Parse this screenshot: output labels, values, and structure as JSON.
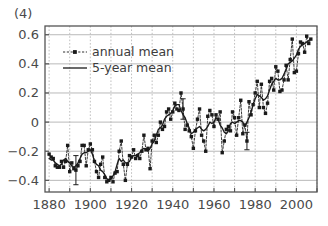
{
  "panel": {
    "label": "(4)"
  },
  "chart_data": {
    "type": "line",
    "title": "",
    "subtitle": "",
    "xlabel": "",
    "ylabel": "",
    "xlim": [
      1878,
      2010
    ],
    "ylim": [
      -0.48,
      0.66
    ],
    "grid": true,
    "x_major_ticks": [
      1880,
      1900,
      1920,
      1940,
      1960,
      1980,
      2000
    ],
    "x_major_tick_labels": [
      "1880",
      "1900",
      "1920",
      "1940",
      "1960",
      "1980",
      "2000"
    ],
    "x_minor_ticks": [
      1890,
      1910,
      1930,
      1950,
      1970,
      1990,
      2010
    ],
    "y_ticks": [
      -0.4,
      -0.2,
      0,
      0.2,
      0.4,
      0.6
    ],
    "y_tick_labels": [
      "−0.4",
      "−0.2",
      "0",
      "0.2",
      "0.4",
      "0.6"
    ],
    "legend_position": "upper left",
    "legend": [
      {
        "name": "annual mean",
        "style": "dashed-marker",
        "marker": "square",
        "color": "#1a1a1a"
      },
      {
        "name": "5-year mean",
        "style": "solid",
        "marker": "none",
        "color": "#1a1a1a"
      }
    ],
    "colors": {
      "annual_mean": "#1a1a1a",
      "five_year_mean": "#1a1a1a",
      "grid": "#b9b9b9",
      "axis": "#555555",
      "background": "#ffffff",
      "text": "#4a4a4a"
    },
    "x": [
      1880,
      1881,
      1882,
      1883,
      1884,
      1885,
      1886,
      1887,
      1888,
      1889,
      1890,
      1891,
      1892,
      1893,
      1894,
      1895,
      1896,
      1897,
      1898,
      1899,
      1900,
      1901,
      1902,
      1903,
      1904,
      1905,
      1906,
      1907,
      1908,
      1909,
      1910,
      1911,
      1912,
      1913,
      1914,
      1915,
      1916,
      1917,
      1918,
      1919,
      1920,
      1921,
      1922,
      1923,
      1924,
      1925,
      1926,
      1927,
      1928,
      1929,
      1930,
      1931,
      1932,
      1933,
      1934,
      1935,
      1936,
      1937,
      1938,
      1939,
      1940,
      1941,
      1942,
      1943,
      1944,
      1945,
      1946,
      1947,
      1948,
      1949,
      1950,
      1951,
      1952,
      1953,
      1954,
      1955,
      1956,
      1957,
      1958,
      1959,
      1960,
      1961,
      1962,
      1963,
      1964,
      1965,
      1966,
      1967,
      1968,
      1969,
      1970,
      1971,
      1972,
      1973,
      1974,
      1975,
      1976,
      1977,
      1978,
      1979,
      1980,
      1981,
      1982,
      1983,
      1984,
      1985,
      1986,
      1987,
      1988,
      1989,
      1990,
      1991,
      1992,
      1993,
      1994,
      1995,
      1996,
      1997,
      1998,
      1999,
      2000,
      2001,
      2002,
      2003,
      2004,
      2005,
      2006,
      2007
    ],
    "series": [
      {
        "name": "annual mean",
        "style": "dashed-marker",
        "values": [
          -0.22,
          -0.24,
          -0.25,
          -0.3,
          -0.31,
          -0.31,
          -0.27,
          -0.31,
          -0.27,
          -0.16,
          -0.34,
          -0.28,
          -0.32,
          -0.33,
          -0.3,
          -0.27,
          -0.16,
          -0.16,
          -0.3,
          -0.19,
          -0.15,
          -0.19,
          -0.27,
          -0.34,
          -0.38,
          -0.29,
          -0.24,
          -0.38,
          -0.41,
          -0.4,
          -0.38,
          -0.41,
          -0.35,
          -0.34,
          -0.2,
          -0.13,
          -0.29,
          -0.4,
          -0.29,
          -0.23,
          -0.24,
          -0.19,
          -0.25,
          -0.23,
          -0.25,
          -0.2,
          -0.09,
          -0.19,
          -0.18,
          -0.32,
          -0.13,
          -0.09,
          -0.14,
          -0.09,
          0.0,
          -0.05,
          -0.03,
          0.07,
          0.09,
          0.02,
          0.07,
          0.13,
          0.09,
          0.08,
          0.2,
          0.09,
          -0.05,
          -0.02,
          -0.06,
          -0.1,
          -0.18,
          -0.06,
          0.02,
          0.09,
          -0.09,
          -0.13,
          -0.2,
          0.04,
          0.08,
          0.05,
          -0.03,
          0.05,
          0.02,
          0.07,
          -0.21,
          -0.13,
          -0.05,
          -0.03,
          -0.06,
          0.07,
          0.03,
          -0.09,
          0.03,
          0.15,
          -0.08,
          -0.02,
          -0.13,
          0.14,
          0.05,
          0.12,
          0.2,
          0.28,
          0.1,
          0.26,
          0.1,
          0.06,
          0.13,
          0.28,
          0.3,
          0.22,
          0.38,
          0.35,
          0.21,
          0.22,
          0.29,
          0.39,
          0.29,
          0.43,
          0.57,
          0.34,
          0.35,
          0.47,
          0.55,
          0.54,
          0.48,
          0.59,
          0.54,
          0.57
        ]
      },
      {
        "name": "5-year mean",
        "style": "solid",
        "values": [
          -0.25,
          -0.26,
          -0.26,
          -0.28,
          -0.29,
          -0.3,
          -0.29,
          -0.26,
          -0.25,
          -0.27,
          -0.28,
          -0.3,
          -0.31,
          -0.3,
          -0.28,
          -0.25,
          -0.22,
          -0.21,
          -0.21,
          -0.2,
          -0.19,
          -0.22,
          -0.27,
          -0.29,
          -0.3,
          -0.33,
          -0.34,
          -0.36,
          -0.39,
          -0.4,
          -0.39,
          -0.37,
          -0.34,
          -0.29,
          -0.25,
          -0.27,
          -0.26,
          -0.28,
          -0.28,
          -0.27,
          -0.24,
          -0.23,
          -0.23,
          -0.22,
          -0.21,
          -0.19,
          -0.18,
          -0.19,
          -0.2,
          -0.18,
          -0.15,
          -0.13,
          -0.09,
          -0.05,
          -0.04,
          -0.02,
          0.02,
          0.04,
          0.05,
          0.06,
          0.08,
          0.11,
          0.12,
          0.12,
          0.08,
          0.05,
          0.03,
          -0.01,
          -0.04,
          -0.08,
          -0.07,
          -0.05,
          -0.04,
          -0.03,
          -0.05,
          -0.06,
          -0.05,
          -0.03,
          0.0,
          -0.01,
          0.0,
          0.03,
          0.02,
          -0.02,
          -0.04,
          -0.07,
          -0.08,
          -0.06,
          -0.01,
          0.0,
          -0.01,
          0.0,
          0.01,
          0.01,
          0.0,
          -0.03,
          0.0,
          0.03,
          0.07,
          0.12,
          0.16,
          0.19,
          0.18,
          0.17,
          0.15,
          0.16,
          0.18,
          0.22,
          0.26,
          0.28,
          0.3,
          0.29,
          0.29,
          0.3,
          0.33,
          0.36,
          0.4,
          0.41,
          0.42,
          0.44,
          0.46,
          0.5,
          0.52,
          0.53,
          0.54,
          0.55,
          0.56,
          0.57
        ]
      }
    ],
    "error_bars": [
      {
        "x": 1893,
        "y": -0.33,
        "err": 0.1
      },
      {
        "x": 1945,
        "y": 0.09,
        "err": 0.07
      },
      {
        "x": 1976,
        "y": -0.13,
        "err": 0.06
      }
    ]
  }
}
